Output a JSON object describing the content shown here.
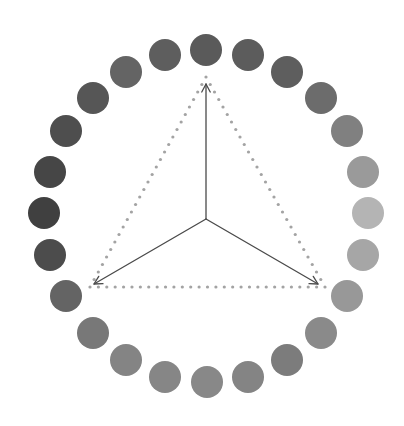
{
  "canvas": {
    "width": 404,
    "height": 426,
    "background": "#ffffff"
  },
  "ring": {
    "center": [
      206,
      216
    ],
    "radius_x": 162,
    "radius_y": 166,
    "circle_radius": 16,
    "count": 24,
    "start_angle_deg": -90,
    "direction": "clockwise",
    "circles": [
      {
        "index": 0,
        "cx": 206,
        "cy": 50,
        "fill": "#5a5a5a"
      },
      {
        "index": 1,
        "cx": 248,
        "cy": 55,
        "fill": "#5c5c5c"
      },
      {
        "index": 2,
        "cx": 287,
        "cy": 72,
        "fill": "#5e5e5e"
      },
      {
        "index": 3,
        "cx": 321,
        "cy": 98,
        "fill": "#6c6c6c"
      },
      {
        "index": 4,
        "cx": 347,
        "cy": 131,
        "fill": "#808080"
      },
      {
        "index": 5,
        "cx": 363,
        "cy": 172,
        "fill": "#9a9a9a"
      },
      {
        "index": 6,
        "cx": 368,
        "cy": 213,
        "fill": "#b4b4b4"
      },
      {
        "index": 7,
        "cx": 363,
        "cy": 255,
        "fill": "#a6a6a6"
      },
      {
        "index": 8,
        "cx": 347,
        "cy": 296,
        "fill": "#989898"
      },
      {
        "index": 9,
        "cx": 321,
        "cy": 333,
        "fill": "#8a8a8a"
      },
      {
        "index": 10,
        "cx": 287,
        "cy": 360,
        "fill": "#7c7c7c"
      },
      {
        "index": 11,
        "cx": 248,
        "cy": 377,
        "fill": "#848484"
      },
      {
        "index": 12,
        "cx": 207,
        "cy": 382,
        "fill": "#888888"
      },
      {
        "index": 13,
        "cx": 165,
        "cy": 377,
        "fill": "#868686"
      },
      {
        "index": 14,
        "cx": 126,
        "cy": 360,
        "fill": "#848484"
      },
      {
        "index": 15,
        "cx": 93,
        "cy": 333,
        "fill": "#787878"
      },
      {
        "index": 16,
        "cx": 66,
        "cy": 296,
        "fill": "#646464"
      },
      {
        "index": 17,
        "cx": 50,
        "cy": 255,
        "fill": "#4c4c4c"
      },
      {
        "index": 18,
        "cx": 44,
        "cy": 213,
        "fill": "#404040"
      },
      {
        "index": 19,
        "cx": 50,
        "cy": 172,
        "fill": "#464646"
      },
      {
        "index": 20,
        "cx": 66,
        "cy": 131,
        "fill": "#4e4e4e"
      },
      {
        "index": 21,
        "cx": 93,
        "cy": 98,
        "fill": "#565656"
      },
      {
        "index": 22,
        "cx": 126,
        "cy": 72,
        "fill": "#646464"
      },
      {
        "index": 23,
        "cx": 165,
        "cy": 55,
        "fill": "#5e5e5e"
      }
    ]
  },
  "triangle": {
    "style": "dotted",
    "dot_color": "#a3a3a3",
    "dot_radius": 1.6,
    "dot_spacing": 8.5,
    "vertices": [
      [
        206,
        77
      ],
      [
        325,
        287
      ],
      [
        90,
        287
      ]
    ]
  },
  "vectors": {
    "color": "#4a4a4a",
    "stroke_width": 1.3,
    "origin": [
      206,
      219
    ],
    "arrow_head_length": 9,
    "arrow_head_half_angle_deg": 28,
    "tips": [
      [
        206,
        84
      ],
      [
        318,
        284
      ],
      [
        94,
        284
      ]
    ]
  }
}
